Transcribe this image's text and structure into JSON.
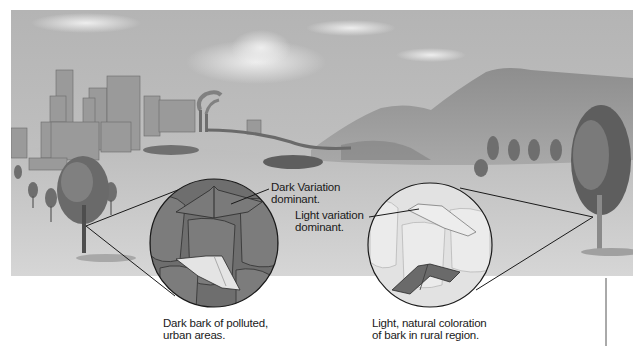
{
  "figure": {
    "colors": {
      "sky": "#bdbdbd",
      "ground": "#cfcfcf",
      "dark_bark": "#6e6e6e",
      "light_bark": "#e2e2e2",
      "dark_moth": "#6a6a6a",
      "light_moth": "#e6e6e6",
      "leader_line": "#1a1a1a",
      "text": "#1a1a1a"
    },
    "scene": {
      "left_region": "city with smokestacks",
      "right_region": "rural hills with trees"
    },
    "callouts": {
      "dark_variation": {
        "line1": "Dark Variation",
        "line2": "dominant."
      },
      "light_variation": {
        "line1": "Light variation",
        "line2": "dominant."
      }
    },
    "captions": {
      "urban": {
        "line1": "Dark bark of polluted,",
        "line2": "urban areas."
      },
      "rural": {
        "line1": "Light, natural coloration",
        "line2": "of bark in rural region."
      }
    }
  }
}
